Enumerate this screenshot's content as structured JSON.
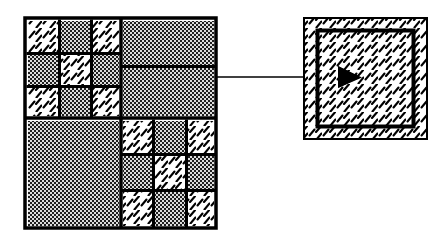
{
  "figure": {
    "background_color": "#ffffff",
    "ink_color": "#000000",
    "fill_colors": {
      "hatch_background": "#ffffff",
      "hatch_stroke": "#000000",
      "dot_background": "#d9d9d9",
      "dot_stroke": "#1a1a1a",
      "solid_black": "#000000"
    }
  },
  "left_panel": {
    "name": "quadtree-map",
    "bounds": {
      "x": 25,
      "y": 18,
      "width": 191,
      "height": 210
    },
    "border_width": 3,
    "quadrants": [
      {
        "name": "top-left-quadrant",
        "bounds": {
          "x": 25,
          "y": 18,
          "width": 96,
          "height": 100
        },
        "subdivision": "3x3",
        "cells": [
          {
            "row": 0,
            "col": 0,
            "fill": "hatch"
          },
          {
            "row": 0,
            "col": 1,
            "fill": "dot"
          },
          {
            "row": 0,
            "col": 2,
            "fill": "hatch"
          },
          {
            "row": 1,
            "col": 0,
            "fill": "dot"
          },
          {
            "row": 1,
            "col": 1,
            "fill": "hatch"
          },
          {
            "row": 1,
            "col": 2,
            "fill": "dot"
          },
          {
            "row": 2,
            "col": 0,
            "fill": "hatch"
          },
          {
            "row": 2,
            "col": 1,
            "fill": "dot"
          },
          {
            "row": 2,
            "col": 2,
            "fill": "hatch"
          }
        ]
      },
      {
        "name": "top-right-quadrant",
        "bounds": {
          "x": 121,
          "y": 18,
          "width": 95,
          "height": 100
        },
        "subdivision": "2-rows",
        "cells": [
          {
            "row": 0,
            "col": 0,
            "fill": "dot"
          },
          {
            "row": 1,
            "col": 0,
            "fill": "dot"
          }
        ]
      },
      {
        "name": "bottom-left-quadrant",
        "bounds": {
          "x": 25,
          "y": 118,
          "width": 96,
          "height": 110
        },
        "subdivision": "1x1",
        "cells": [
          {
            "row": 0,
            "col": 0,
            "fill": "dot"
          }
        ]
      },
      {
        "name": "bottom-right-quadrant",
        "bounds": {
          "x": 121,
          "y": 118,
          "width": 95,
          "height": 110
        },
        "subdivision": "3x3",
        "cells": [
          {
            "row": 0,
            "col": 0,
            "fill": "hatch"
          },
          {
            "row": 0,
            "col": 1,
            "fill": "dot"
          },
          {
            "row": 0,
            "col": 2,
            "fill": "hatch"
          },
          {
            "row": 1,
            "col": 0,
            "fill": "dot"
          },
          {
            "row": 1,
            "col": 1,
            "fill": "hatch"
          },
          {
            "row": 1,
            "col": 2,
            "fill": "dot"
          },
          {
            "row": 2,
            "col": 0,
            "fill": "hatch"
          },
          {
            "row": 2,
            "col": 1,
            "fill": "dot"
          },
          {
            "row": 2,
            "col": 2,
            "fill": "hatch"
          }
        ]
      }
    ]
  },
  "connector": {
    "name": "callout-line",
    "from": {
      "x": 216,
      "y": 77
    },
    "to": {
      "x": 313,
      "y": 77
    },
    "stroke_width": 1.5,
    "style": "solid"
  },
  "right_panel": {
    "name": "detail-cell",
    "outer": {
      "x": 303,
      "y": 17,
      "width": 125,
      "height": 123
    },
    "outer_border_width": 2,
    "inner": {
      "x": 316,
      "y": 29,
      "width": 99,
      "height": 99
    },
    "inner_border_width": 4,
    "fill": "hatch",
    "marker": {
      "name": "direction-arrowhead",
      "shape": "triangle-right",
      "x": 338,
      "y": 66,
      "width": 24,
      "height": 22,
      "color": "#000000"
    }
  }
}
